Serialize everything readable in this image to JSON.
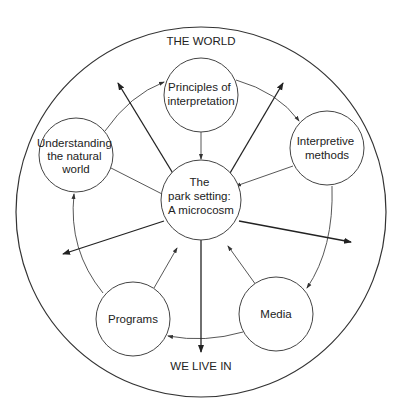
{
  "diagram": {
    "outer_label_top": "THE WORLD",
    "outer_label_bottom": "WE LIVE IN",
    "center_node": {
      "lines": [
        "The",
        "park setting:",
        "A microcosm"
      ]
    },
    "nodes": [
      {
        "id": "principles",
        "lines": [
          "Principles of",
          "interpretation"
        ]
      },
      {
        "id": "methods",
        "lines": [
          "Interpretive",
          "methods"
        ]
      },
      {
        "id": "media",
        "lines": [
          "Media"
        ]
      },
      {
        "id": "programs",
        "lines": [
          "Programs"
        ]
      },
      {
        "id": "understanding",
        "lines": [
          "Understanding",
          "the natural",
          "world"
        ]
      }
    ],
    "cycle_order": [
      "principles",
      "methods",
      "media",
      "programs",
      "understanding",
      "principles"
    ],
    "edges_to_center": [
      "principles",
      "methods",
      "media",
      "programs",
      "understanding"
    ],
    "outward_arrows_from_center": 5,
    "colors": {
      "stroke": "#333333",
      "text": "#222222",
      "background": "#ffffff"
    }
  }
}
